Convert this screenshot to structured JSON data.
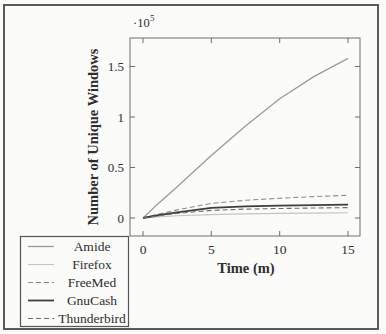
{
  "chart_data": {
    "type": "line",
    "title": "",
    "xlabel": "Time (m)",
    "ylabel": "Number of Unique Windows",
    "y_multiplier_base": "·10",
    "y_multiplier_exp": "5",
    "x_tick_labels": [
      "0",
      "5",
      "10",
      "15"
    ],
    "y_tick_labels": [
      "0",
      "0.5",
      "1",
      "1.5"
    ],
    "x_ticks": [
      0,
      5,
      10,
      15
    ],
    "y_ticks": [
      0,
      0.5,
      1,
      1.5
    ],
    "xlim": [
      -0.95,
      15.9
    ],
    "ylim": [
      -0.18,
      1.78
    ],
    "y_unit": "1e5",
    "grid": "off",
    "legend_position": "outside-bottom-left",
    "x": [
      0,
      1,
      2.5,
      5,
      7.5,
      10,
      12.5,
      15
    ],
    "series": [
      {
        "name": "Amide",
        "color": "#9a9a9a",
        "width": 1.3,
        "dash": "",
        "values": [
          0,
          0.13,
          0.31,
          0.62,
          0.91,
          1.18,
          1.4,
          1.58
        ]
      },
      {
        "name": "Firefox",
        "color": "#c4c4c4",
        "width": 1.1,
        "dash": "",
        "values": [
          0,
          0.01,
          0.022,
          0.034,
          0.041,
          0.046,
          0.049,
          0.052
        ]
      },
      {
        "name": "FreeMed",
        "color": "#8c8c8c",
        "width": 1.1,
        "dash": "5,3",
        "values": [
          0,
          0.035,
          0.08,
          0.145,
          0.175,
          0.196,
          0.212,
          0.225
        ]
      },
      {
        "name": "GnuCash",
        "color": "#3e3e3e",
        "width": 1.8,
        "dash": "",
        "values": [
          0,
          0.025,
          0.055,
          0.1,
          0.115,
          0.123,
          0.128,
          0.133
        ]
      },
      {
        "name": "Thunderbird",
        "color": "#6e6e6e",
        "width": 1.1,
        "dash": "5,3",
        "values": [
          0,
          0.02,
          0.045,
          0.075,
          0.088,
          0.094,
          0.099,
          0.103
        ]
      }
    ]
  }
}
